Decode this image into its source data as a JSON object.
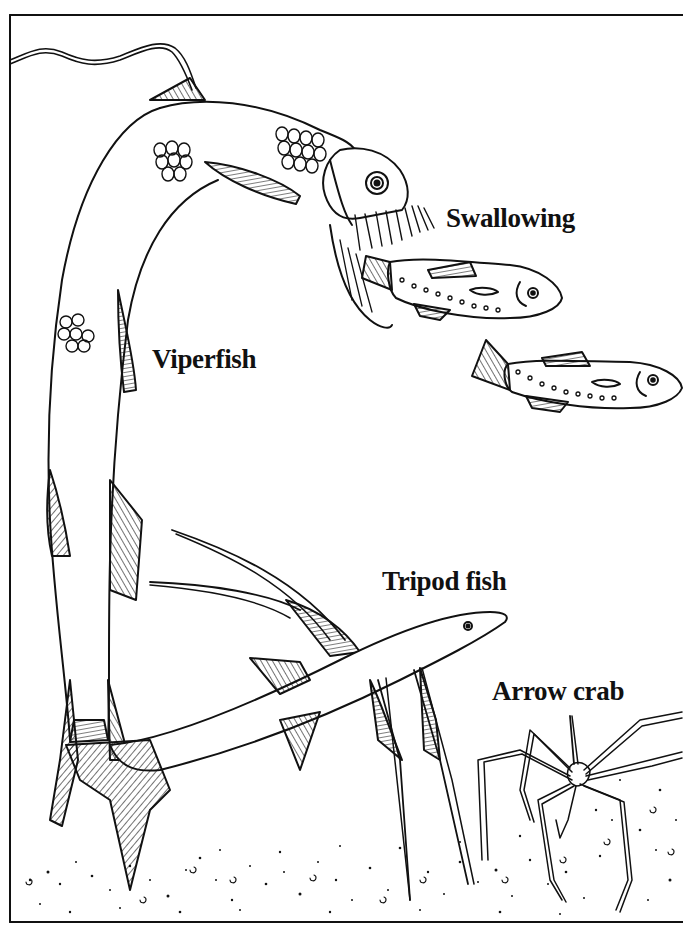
{
  "page": {
    "type": "coloring-book illustration",
    "theme": "deep sea creatures"
  },
  "labels": {
    "swallowing": "Swallowing",
    "viperfish": "Viperfish",
    "tripod_fish": "Tripod fish",
    "arrow_crab": "Arrow crab"
  },
  "figures": [
    {
      "name": "viperfish",
      "description": "long eel-like fish arching over, jaws open with needle teeth"
    },
    {
      "name": "prey-fish-1",
      "description": "small fish being swallowed by viperfish"
    },
    {
      "name": "prey-fish-2",
      "description": "small fish swimming toward viperfish"
    },
    {
      "name": "tripod-fish",
      "description": "fish resting on sea floor on elongated fin rays"
    },
    {
      "name": "arrow-crab",
      "description": "spindly long-legged crab on sea floor"
    },
    {
      "name": "sea-floor",
      "description": "dotted sandy bottom"
    }
  ],
  "colors": {
    "ink": "#111111",
    "paper": "#ffffff"
  }
}
